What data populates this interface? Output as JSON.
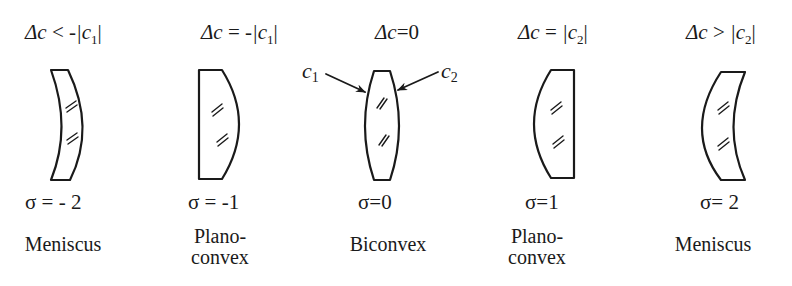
{
  "figure": {
    "lenses": [
      {
        "condition_lhs": "Δc",
        "condition_op": "<",
        "condition_rhs_prefix": "-|c",
        "condition_sub": "1",
        "condition_rhs_suffix": "|",
        "sigma": "σ = - 2",
        "name_line1": "Meniscus",
        "name_line2": ""
      },
      {
        "condition_lhs": "Δc",
        "condition_op": "=",
        "condition_rhs_prefix": "-|c",
        "condition_sub": "1",
        "condition_rhs_suffix": "|",
        "sigma": "σ = -1",
        "name_line1": "Plano-",
        "name_line2": "convex"
      },
      {
        "condition_lhs": "Δc",
        "condition_op": "=",
        "condition_rhs_prefix": "0",
        "condition_sub": "",
        "condition_rhs_suffix": "",
        "sigma": "σ=0",
        "name_line1": "Biconvex",
        "name_line2": ""
      },
      {
        "condition_lhs": "Δc",
        "condition_op": "=",
        "condition_rhs_prefix": "|c",
        "condition_sub": "2",
        "condition_rhs_suffix": "|",
        "sigma": "σ=1",
        "name_line1": "Plano-",
        "name_line2": "convex"
      },
      {
        "condition_lhs": "Δc",
        "condition_op": ">",
        "condition_rhs_prefix": "|c",
        "condition_sub": "2",
        "condition_rhs_suffix": "|",
        "sigma": "σ= 2",
        "name_line1": "Meniscus",
        "name_line2": ""
      }
    ],
    "pointers": {
      "left": {
        "letter": "c",
        "sub": "1"
      },
      "right": {
        "letter": "c",
        "sub": "2"
      }
    },
    "stroke_color": "#1a1a1a"
  }
}
